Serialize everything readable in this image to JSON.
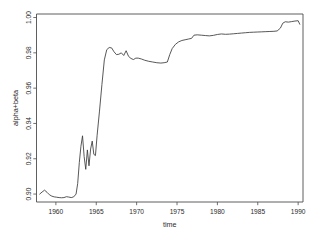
{
  "chart_data": {
    "type": "line",
    "title": "",
    "xlabel": "time",
    "ylabel": "alpha+beta",
    "xlim": [
      1957.6,
      1990.6
    ],
    "ylim": [
      0.8955,
      1.002
    ],
    "grid": false,
    "legend": false,
    "xticks": [
      1960,
      1965,
      1970,
      1975,
      1980,
      1985,
      1990
    ],
    "xticklabels": [
      "1960",
      "1965",
      "1970",
      "1975",
      "1980",
      "1985",
      "1990"
    ],
    "yticks": [
      0.9,
      0.92,
      0.94,
      0.96,
      0.98,
      1.0
    ],
    "yticklabels": [
      "0.90",
      "0.92",
      "0.94",
      "0.96",
      "0.98",
      "1.00"
    ],
    "line_color": "#3a3a3a",
    "axis_color": "#4d4d4d",
    "background": "#ffffff",
    "series": [
      {
        "name": "alpha+beta",
        "x": [
          1958.0,
          1958.3,
          1958.6,
          1958.9,
          1959.2,
          1959.5,
          1959.8,
          1960.1,
          1960.4,
          1960.7,
          1961.0,
          1961.3,
          1961.6,
          1961.9,
          1962.2,
          1962.5,
          1962.7,
          1962.9,
          1963.1,
          1963.3,
          1963.5,
          1963.7,
          1963.9,
          1964.1,
          1964.3,
          1964.5,
          1964.7,
          1964.9,
          1965.1,
          1965.4,
          1965.7,
          1966.0,
          1966.3,
          1966.6,
          1966.9,
          1967.2,
          1967.5,
          1967.8,
          1968.1,
          1968.4,
          1968.7,
          1969.0,
          1969.3,
          1969.6,
          1969.9,
          1970.2,
          1970.6,
          1971.0,
          1971.5,
          1972.0,
          1972.5,
          1973.0,
          1973.4,
          1973.8,
          1974.1,
          1974.4,
          1974.8,
          1975.2,
          1975.6,
          1976.0,
          1976.4,
          1976.8,
          1977.1,
          1977.5,
          1978.0,
          1978.5,
          1979.0,
          1979.5,
          1980.0,
          1980.5,
          1981.0,
          1981.5,
          1982.0,
          1982.5,
          1983.0,
          1983.5,
          1984.0,
          1984.5,
          1985.0,
          1985.5,
          1986.0,
          1986.5,
          1987.0,
          1987.4,
          1987.8,
          1988.1,
          1988.4,
          1988.8,
          1989.2,
          1989.6,
          1990.0,
          1990.2
        ],
        "y": [
          0.9,
          0.9012,
          0.9022,
          0.901,
          0.8996,
          0.8988,
          0.8984,
          0.8982,
          0.898,
          0.8979,
          0.898,
          0.8985,
          0.8983,
          0.898,
          0.8984,
          0.9,
          0.906,
          0.9178,
          0.927,
          0.933,
          0.9212,
          0.914,
          0.925,
          0.916,
          0.9255,
          0.93,
          0.9225,
          0.9218,
          0.933,
          0.947,
          0.962,
          0.976,
          0.9818,
          0.983,
          0.9828,
          0.9806,
          0.979,
          0.9792,
          0.98,
          0.9785,
          0.9812,
          0.978,
          0.9768,
          0.9762,
          0.977,
          0.977,
          0.9765,
          0.9758,
          0.9752,
          0.9748,
          0.9744,
          0.9742,
          0.9744,
          0.9748,
          0.979,
          0.9824,
          0.9848,
          0.9862,
          0.987,
          0.9874,
          0.9878,
          0.9882,
          0.99,
          0.9902,
          0.99,
          0.9898,
          0.9896,
          0.9899,
          0.9904,
          0.9907,
          0.9905,
          0.9906,
          0.9908,
          0.991,
          0.9912,
          0.9914,
          0.9916,
          0.9917,
          0.9918,
          0.9919,
          0.992,
          0.9921,
          0.9922,
          0.9924,
          0.994,
          0.9968,
          0.9976,
          0.9974,
          0.9977,
          0.998,
          0.9982,
          0.9962
        ]
      }
    ]
  }
}
